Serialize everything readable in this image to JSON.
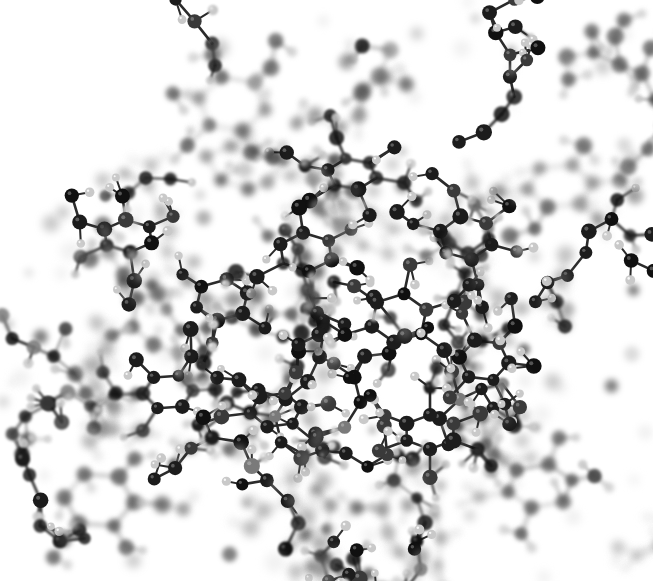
{
  "image": {
    "kind": "molecular-structure-render",
    "title": "Ball-and-stick molecular model",
    "description": "Grayscale ball-and-stick rendering of a dense branched carbohydrate/oligosaccharide network with depth-of-field blur",
    "width": 653,
    "height": 581,
    "background_color": "#ffffff",
    "has_text_labels": false,
    "has_axes": false,
    "has_legend": false
  },
  "render_style": {
    "representation": "ball-and-stick",
    "color_mode": "grayscale",
    "depth_of_field": true,
    "focal_plane_depth": 0.46,
    "blur_max_px": 4.2,
    "bond_width_px": 2.6,
    "atom_radius_px": 7.2,
    "hydrogen_radius_px": 4.6,
    "specular_highlight": true
  },
  "palette": {
    "carbon": "#1c1c1c",
    "carbon_dark": "#101010",
    "oxygen": "#3a3a3a",
    "heteroatom_gray": "#7a7a7a",
    "hydrogen": "#c9c9c9",
    "hydrogen_light": "#dedede",
    "bond": "#2b2b2b",
    "bond_faded": "#8d8d8d",
    "background": "#ffffff",
    "highlight": "#f2f2f2"
  },
  "structure_stats": {
    "heavy_atom_count": 268,
    "hydrogen_count": 196,
    "bond_count": 452,
    "ring_count": 14,
    "ring_size": 6
  },
  "rings": [
    {
      "id": "ring-1",
      "cx": 232,
      "cy": 104,
      "r": 34,
      "depth": 0.78,
      "rot": 12,
      "note": "upper-center pyranose ring"
    },
    {
      "id": "ring-2",
      "cx": 560,
      "cy": 186,
      "r": 33,
      "depth": 0.8,
      "rot": -8,
      "note": "upper-right pyranose ring"
    },
    {
      "id": "ring-3",
      "cx": 99,
      "cy": 500,
      "r": 35,
      "depth": 0.74,
      "rot": 5,
      "note": "lower-left pyranose ring"
    },
    {
      "id": "ring-4",
      "cx": 540,
      "cy": 486,
      "r": 33,
      "depth": 0.72,
      "rot": -15,
      "note": "lower-right pyranose ring"
    },
    {
      "id": "ring-5",
      "cx": 306,
      "cy": 252,
      "r": 28,
      "depth": 0.52,
      "rot": 24,
      "note": "central ring"
    },
    {
      "id": "ring-6",
      "cx": 222,
      "cy": 300,
      "r": 27,
      "depth": 0.44,
      "rot": -20,
      "note": "central ring"
    },
    {
      "id": "ring-7",
      "cx": 399,
      "cy": 318,
      "r": 29,
      "depth": 0.5,
      "rot": 40,
      "note": "central ring"
    },
    {
      "id": "ring-8",
      "cx": 128,
      "cy": 236,
      "r": 26,
      "depth": 0.4,
      "rot": -35,
      "note": "left ring"
    },
    {
      "id": "ring-9",
      "cx": 466,
      "cy": 238,
      "r": 27,
      "depth": 0.46,
      "rot": 18,
      "note": "right ring"
    },
    {
      "id": "ring-10",
      "cx": 276,
      "cy": 410,
      "r": 26,
      "depth": 0.42,
      "rot": -10,
      "note": "lower-center ring"
    },
    {
      "id": "ring-11",
      "cx": 430,
      "cy": 432,
      "r": 27,
      "depth": 0.48,
      "rot": 30,
      "note": "lower-right-center ring"
    },
    {
      "id": "ring-12",
      "cx": 168,
      "cy": 392,
      "r": 25,
      "depth": 0.36,
      "rot": 55,
      "note": "lower-left-center ring"
    },
    {
      "id": "ring-13",
      "cx": 352,
      "cy": 174,
      "r": 25,
      "depth": 0.38,
      "rot": -45,
      "note": "upper-center-left ring"
    },
    {
      "id": "ring-14",
      "cx": 484,
      "cy": 360,
      "r": 25,
      "depth": 0.43,
      "rot": 8,
      "note": "right-center ring"
    }
  ],
  "density_field": {
    "note": "relative atom density per region used to seed the branched network",
    "regions": [
      {
        "name": "top-left",
        "x": 0,
        "y": 0,
        "w": 218,
        "h": 194,
        "density": 0.05
      },
      {
        "name": "top-center",
        "x": 218,
        "y": 0,
        "w": 218,
        "h": 194,
        "density": 0.42
      },
      {
        "name": "top-right",
        "x": 436,
        "y": 0,
        "w": 217,
        "h": 194,
        "density": 0.34
      },
      {
        "name": "mid-left",
        "x": 0,
        "y": 194,
        "w": 218,
        "h": 194,
        "density": 0.72
      },
      {
        "name": "mid-center",
        "x": 218,
        "y": 194,
        "w": 218,
        "h": 194,
        "density": 1.0
      },
      {
        "name": "mid-right",
        "x": 436,
        "y": 194,
        "w": 217,
        "h": 194,
        "density": 0.76
      },
      {
        "name": "bottom-left",
        "x": 0,
        "y": 388,
        "w": 218,
        "h": 193,
        "density": 0.4
      },
      {
        "name": "bottom-center",
        "x": 218,
        "y": 388,
        "w": 218,
        "h": 193,
        "density": 0.66
      },
      {
        "name": "bottom-right",
        "x": 436,
        "y": 388,
        "w": 217,
        "h": 193,
        "density": 0.5
      }
    ]
  },
  "generation": {
    "seed": 20240917,
    "chain_count": 34,
    "chain_min_len": 4,
    "chain_max_len": 13,
    "branch_probability": 0.36,
    "hydrogen_probability": 0.62,
    "step_min_px": 20,
    "step_max_px": 30
  }
}
